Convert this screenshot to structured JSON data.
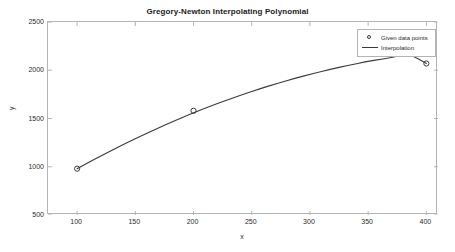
{
  "chart_data": {
    "type": "line",
    "title": "Gregory-Newton Interpolating Polynomial",
    "xlabel": "x",
    "ylabel": "y",
    "xlim": [
      75,
      410
    ],
    "ylim": [
      500,
      2500
    ],
    "xticks": [
      100,
      150,
      200,
      250,
      300,
      350,
      400
    ],
    "xtick_labels": [
      "100",
      "150",
      "200",
      "250",
      "300",
      "350",
      "400"
    ],
    "yticks": [
      500,
      1000,
      1500,
      2000,
      2500
    ],
    "ytick_labels": [
      "500",
      "1000",
      "1500",
      "2000",
      "2500"
    ],
    "grid": false,
    "legend_position": "top-right",
    "series": [
      {
        "name": "Given data points",
        "style": "marker",
        "marker": "circle",
        "color": "#3a3a3a",
        "x": [
          100,
          200,
          400
        ],
        "y": [
          980,
          1580,
          2070
        ]
      },
      {
        "name": "Interpolation",
        "style": "line",
        "color": "#3a3a3a",
        "x": [
          100,
          115,
          130,
          145,
          160,
          175,
          190,
          205,
          220,
          235,
          250,
          265,
          280,
          295,
          310,
          325,
          340,
          355,
          370,
          385,
          400
        ],
        "y": [
          980,
          1078,
          1172,
          1262,
          1348,
          1430,
          1508,
          1582,
          1652,
          1718,
          1780,
          1838,
          1892,
          1942,
          1988,
          2030,
          2068,
          2102,
          2132,
          2158,
          2070
        ]
      }
    ]
  },
  "legend": {
    "entries": [
      {
        "label": "Given data points"
      },
      {
        "label": "Interpolation"
      }
    ]
  }
}
